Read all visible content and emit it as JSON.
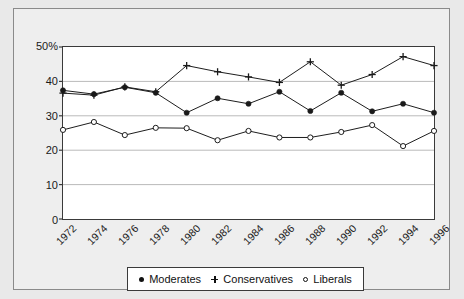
{
  "chart_data": {
    "type": "line",
    "title": "",
    "xlabel": "",
    "ylabel": "",
    "ylim": [
      0,
      50
    ],
    "yticks": [
      0,
      10,
      20,
      30,
      40,
      50
    ],
    "ytick_labels": [
      "0",
      "10",
      "20",
      "30",
      "40",
      "50%"
    ],
    "grid": "horizontal",
    "legend_position": "bottom",
    "categories": [
      "1972",
      "1974",
      "1976",
      "1978",
      "1980",
      "1982",
      "1984",
      "1986",
      "1988",
      "1990",
      "1992",
      "1994",
      "1996"
    ],
    "series": [
      {
        "name": "Moderates",
        "marker": "filled-circle",
        "values": [
          37.4,
          36.3,
          38.3,
          36.7,
          30.9,
          35.1,
          33.5,
          37.0,
          31.4,
          36.7,
          31.3,
          33.5,
          30.9
        ]
      },
      {
        "name": "Conservatives",
        "marker": "plus",
        "values": [
          36.6,
          36.0,
          38.4,
          37.0,
          44.6,
          42.8,
          41.3,
          39.7,
          45.7,
          38.9,
          42.0,
          47.2,
          44.6
        ]
      },
      {
        "name": "Liberals",
        "marker": "open-circle",
        "values": [
          25.9,
          28.2,
          24.4,
          26.5,
          26.4,
          22.9,
          25.6,
          23.7,
          23.7,
          25.3,
          27.3,
          21.2,
          25.6
        ]
      }
    ]
  },
  "legend": {
    "entries": [
      {
        "label": "Moderates",
        "marker": "filled-circle"
      },
      {
        "label": "Conservatives",
        "marker": "plus"
      },
      {
        "label": "Liberals",
        "marker": "open-circle"
      }
    ]
  },
  "colors": {
    "series_line": "#1a1a1a",
    "grid": "#b9b9b9",
    "axis": "#3a3a3a",
    "plot_background": "#ffffff",
    "figure_background": "#e9e9e9"
  }
}
